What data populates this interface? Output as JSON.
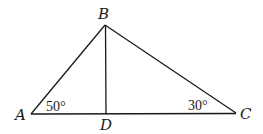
{
  "diagram": {
    "type": "triangle",
    "points": {
      "A": {
        "label": "A",
        "x": 31,
        "y": 114
      },
      "B": {
        "label": "B",
        "x": 105,
        "y": 25
      },
      "C": {
        "label": "C",
        "x": 236,
        "y": 113
      },
      "D": {
        "label": "D",
        "x": 106,
        "y": 114
      }
    },
    "segments": [
      "AB",
      "BC",
      "AC",
      "BD"
    ],
    "angles": [
      {
        "vertex": "A",
        "label": "50°"
      },
      {
        "vertex": "C",
        "label": "30°"
      }
    ],
    "stroke_color": "#1a1a1a",
    "background": "#ffffff"
  }
}
